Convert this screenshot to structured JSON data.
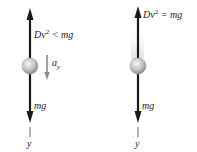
{
  "panels": [
    {
      "id": "left",
      "top_force_label": {
        "base": "Dv",
        "exp": "2",
        "rel": " < mg"
      },
      "bottom_force_label": "mg",
      "accel_label": {
        "base": "a",
        "sub": "y"
      },
      "axis_label": "y"
    },
    {
      "id": "right",
      "top_force_label": {
        "base": "Dv",
        "exp": "2",
        "rel": " = mg"
      },
      "bottom_force_label": "mg",
      "axis_label": "y"
    }
  ],
  "colors": {
    "arrow": "#1a1a1a",
    "accel_arrow": "#8a8a8a",
    "sphere_light": "#e8e8e8",
    "sphere_dark": "#8c8c8c",
    "axis_line": "#555555",
    "blur": "#d9d9d9"
  }
}
